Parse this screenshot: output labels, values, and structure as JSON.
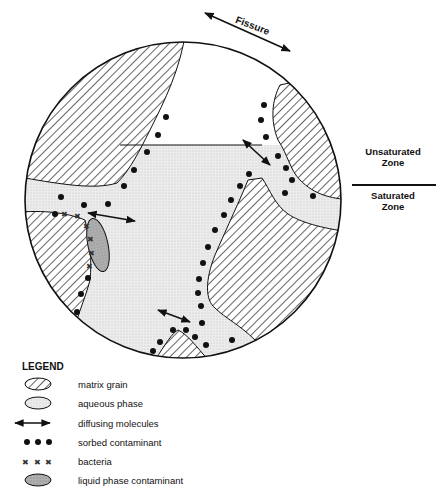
{
  "figure": {
    "fissure_label": "Fissure",
    "zones": {
      "unsaturated": "Unsaturated Zone",
      "unsaturated_line1": "Unsaturated",
      "unsaturated_line2": "Zone",
      "saturated_line1": "Saturated",
      "saturated_line2": "Zone"
    },
    "colors": {
      "outline": "#111111",
      "aqueous_fill": "#e6e6e6",
      "liquid_contaminant_fill": "#a8a8a8",
      "background": "#ffffff"
    }
  },
  "legend": {
    "title": "LEGEND",
    "items": [
      {
        "symbol": "hatched-ellipse",
        "label": "matrix grain"
      },
      {
        "symbol": "stippled-ellipse",
        "label": "aqueous phase"
      },
      {
        "symbol": "double-arrow",
        "label": "diffusing molecules"
      },
      {
        "symbol": "dots",
        "label": "sorbed contaminant"
      },
      {
        "symbol": "crosses",
        "label": "bacteria"
      },
      {
        "symbol": "dark-stippled-ellipse",
        "label": "liquid phase contaminant"
      }
    ]
  }
}
